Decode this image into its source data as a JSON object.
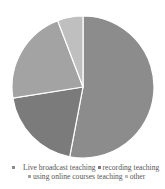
{
  "chart_data": {
    "type": "pie",
    "title": "",
    "start_angle": "12 o'clock, counterclockwise",
    "categories": [
      "Live broadcast teaching",
      "recording teaching",
      "using online courses teaching",
      "other"
    ],
    "values": [
      53,
      19.5,
      21.7,
      5.8
    ],
    "unit": "%",
    "colors": [
      "#8c8c8c",
      "#7b7b7b",
      "#a3a3a3",
      "#bfbfbf"
    ],
    "legend_position": "bottom",
    "data_labels": false
  },
  "legend": {
    "items": [
      {
        "label": "Live broadcast teaching",
        "color": "#8c8c8c"
      },
      {
        "label": "recording teaching",
        "color": "#7b7b7b"
      },
      {
        "label": "using online courses teaching",
        "color": "#a3a3a3"
      },
      {
        "label": "other",
        "color": "#bfbfbf"
      }
    ]
  }
}
